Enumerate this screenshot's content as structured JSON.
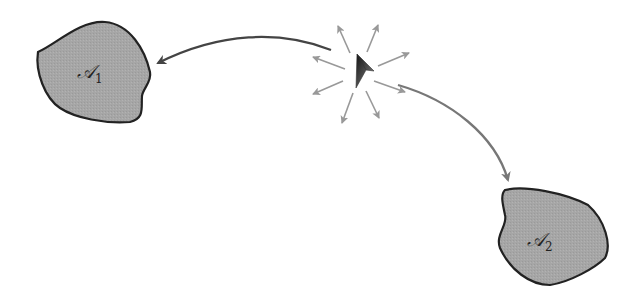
{
  "diagram": {
    "regions": [
      {
        "id": "A1",
        "symbol": "𝒜",
        "subscript": "1",
        "fill": "#a8a8a8",
        "stroke": "#222222"
      },
      {
        "id": "A2",
        "symbol": "𝒜",
        "subscript": "2",
        "fill": "#a8a8a8",
        "stroke": "#222222"
      }
    ],
    "center": {
      "name": "agent-cursor",
      "burst_arrows": 8,
      "burst_color": "#999999"
    },
    "arrows": [
      {
        "from": "center",
        "to": "A1",
        "color": "#444444"
      },
      {
        "from": "center",
        "to": "A2",
        "color": "#777777"
      }
    ]
  }
}
